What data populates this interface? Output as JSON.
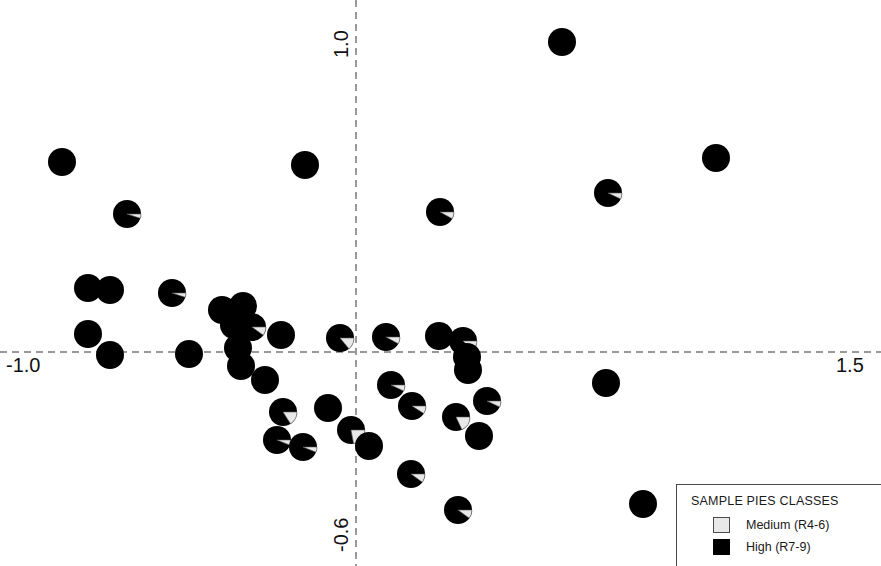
{
  "axes": {
    "x_min_label": "-1.0",
    "y_max_label": "1.0",
    "x_max_label": "1.5",
    "y_min_label": "-0.6",
    "line_color": "#999999",
    "style": "dashed"
  },
  "legend": {
    "title": "SAMPLE PIES CLASSES",
    "items": [
      {
        "label": "Medium (R4-6)",
        "color": "#e8e8e8",
        "key": "medium"
      },
      {
        "label": "High (R7-9)",
        "color": "#000000",
        "key": "high"
      }
    ]
  },
  "chart_data": {
    "type": "scatter",
    "title": "",
    "xlabel": "",
    "ylabel": "",
    "xlim": [
      -1.0,
      1.5
    ],
    "ylim": [
      -0.6,
      1.0
    ],
    "xticks": [
      -1.0,
      1.5
    ],
    "yticks": [
      -0.6,
      1.0
    ],
    "grid": false,
    "legend_position": "bottom-right",
    "marker": "pie",
    "marker_radius_px": 14,
    "series": [
      {
        "name": "Medium (R4-6)",
        "color": "#e8e8e8"
      },
      {
        "name": "High (R7-9)",
        "color": "#000000"
      }
    ],
    "points": [
      {
        "px": 562,
        "py": 42,
        "medium": 0.0
      },
      {
        "px": 62,
        "py": 162,
        "medium": 0.0
      },
      {
        "px": 305,
        "py": 165,
        "medium": 0.0
      },
      {
        "px": 716,
        "py": 158,
        "medium": 0.0
      },
      {
        "px": 608,
        "py": 193,
        "medium": 0.07
      },
      {
        "px": 127,
        "py": 214,
        "medium": 0.05
      },
      {
        "px": 440,
        "py": 212,
        "medium": 0.08
      },
      {
        "px": 88,
        "py": 288,
        "medium": 0.0
      },
      {
        "px": 110,
        "py": 290,
        "medium": 0.0
      },
      {
        "px": 172,
        "py": 293,
        "medium": 0.05
      },
      {
        "px": 222,
        "py": 310,
        "medium": 0.0
      },
      {
        "px": 243,
        "py": 306,
        "medium": 0.0
      },
      {
        "px": 234,
        "py": 325,
        "medium": 0.0
      },
      {
        "px": 252,
        "py": 327,
        "medium": 0.1
      },
      {
        "px": 88,
        "py": 334,
        "medium": 0.0
      },
      {
        "px": 281,
        "py": 335,
        "medium": 0.0
      },
      {
        "px": 340,
        "py": 338,
        "medium": 0.14
      },
      {
        "px": 386,
        "py": 337,
        "medium": 0.08
      },
      {
        "px": 439,
        "py": 336,
        "medium": 0.0
      },
      {
        "px": 463,
        "py": 341,
        "medium": 0.12
      },
      {
        "px": 110,
        "py": 355,
        "medium": 0.0
      },
      {
        "px": 189,
        "py": 354,
        "medium": 0.0
      },
      {
        "px": 238,
        "py": 348,
        "medium": 0.0
      },
      {
        "px": 241,
        "py": 366,
        "medium": 0.0
      },
      {
        "px": 265,
        "py": 380,
        "medium": 0.0
      },
      {
        "px": 467,
        "py": 357,
        "medium": 0.0
      },
      {
        "px": 468,
        "py": 370,
        "medium": 0.0
      },
      {
        "px": 606,
        "py": 383,
        "medium": 0.0
      },
      {
        "px": 391,
        "py": 385,
        "medium": 0.07
      },
      {
        "px": 328,
        "py": 408,
        "medium": 0.0
      },
      {
        "px": 283,
        "py": 412,
        "medium": 0.16
      },
      {
        "px": 412,
        "py": 406,
        "medium": 0.09
      },
      {
        "px": 487,
        "py": 401,
        "medium": 0.07
      },
      {
        "px": 456,
        "py": 417,
        "medium": 0.18
      },
      {
        "px": 351,
        "py": 430,
        "medium": 0.22
      },
      {
        "px": 277,
        "py": 440,
        "medium": 0.06
      },
      {
        "px": 303,
        "py": 447,
        "medium": 0.06
      },
      {
        "px": 369,
        "py": 446,
        "medium": 0.0
      },
      {
        "px": 479,
        "py": 436,
        "medium": 0.0
      },
      {
        "px": 411,
        "py": 474,
        "medium": 0.1
      },
      {
        "px": 458,
        "py": 510,
        "medium": 0.1
      },
      {
        "px": 643,
        "py": 504,
        "medium": 0.0
      }
    ]
  }
}
